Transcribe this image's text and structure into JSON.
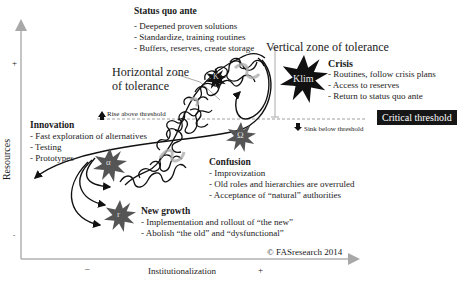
{
  "axes": {
    "y_label": "Resources",
    "y_plus": "+",
    "y_minus": "-",
    "x_label": "Institutionalization",
    "x_minus": "–",
    "x_plus": "+"
  },
  "status_quo": {
    "title": "Status quo ante",
    "items": [
      "- Deepened proven solutions",
      "- Standardize, training routines",
      "- Buffers, reserves, create storage"
    ]
  },
  "zones": {
    "horizontal": [
      "Horizontal zone",
      "of tolerance"
    ],
    "vertical": "Vertical zone of tolerance"
  },
  "crisis": {
    "title": "Crisis",
    "items": [
      "- Routines, follow crisis plans",
      "- Access to reserves",
      "- Return to status quo ante"
    ],
    "star_label": "Klim"
  },
  "threshold": {
    "rise": "Rise above threshold",
    "sink": "Sink below threshold",
    "label": "Critical threshold"
  },
  "innovation": {
    "title": "Innovation",
    "items": [
      "- Fast exploration of alternatives",
      "- Testing",
      "- Prototypes"
    ],
    "star_label": "α"
  },
  "confusion": {
    "title": "Confusion",
    "items": [
      "- Improvization",
      "- Old roles and hierarchies are overruled",
      "- Acceptance of “natural” authorities"
    ],
    "star_label": "Ω"
  },
  "new_growth": {
    "title": "New growth",
    "items": [
      "- Implementation and rollout of “the new”",
      "- Abolish “the old” and “dysfunctional”"
    ],
    "star_label": "r"
  },
  "k_star_label": "K",
  "copyright": "© FASresearch 2014",
  "colors": {
    "axis": "#a8a8a8",
    "star_dark": "#111111",
    "star_gray": "#555555",
    "threshold_box": "#161616"
  }
}
